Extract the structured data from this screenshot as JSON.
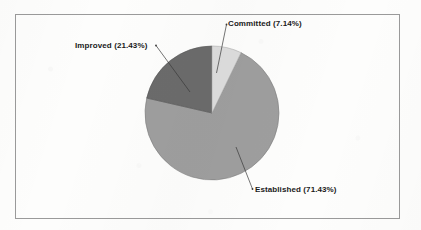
{
  "chart_data": {
    "type": "pie",
    "title": "",
    "subtitle": "",
    "xlabel": "",
    "ylabel": "",
    "grid": false,
    "legend_position": "none",
    "labels_position": "outside-with-leader-lines",
    "start_angle_deg": 0,
    "direction": "clockwise",
    "categories": [
      "Committed",
      "Established",
      "Improved"
    ],
    "values": [
      7.14,
      71.43,
      21.43
    ],
    "value_unit": "%",
    "slices": [
      {
        "name": "Committed",
        "value": 7.14,
        "label": "Committed (7.14%)",
        "color": "#dcdcdc",
        "start_angle_deg": 0,
        "end_angle_deg": 25.7
      },
      {
        "name": "Established",
        "value": 71.43,
        "label": "Established (71.43%)",
        "color": "#9e9e9e",
        "start_angle_deg": 25.7,
        "end_angle_deg": 282.9
      },
      {
        "name": "Improved",
        "value": 21.43,
        "label": "Improved (21.43%)",
        "color": "#6b6b6b",
        "start_angle_deg": 282.9,
        "end_angle_deg": 360
      }
    ]
  },
  "chart": {
    "border_color": "#9a9a9a",
    "background_color": "#fdfdfc",
    "label_color": "#1a1a1a",
    "leader_line_color": "#3a3a3a",
    "center_x": 212,
    "center_y": 113,
    "radius": 67
  },
  "labels": {
    "committed": "Committed (7.14%)",
    "improved": "Improved (21.43%)",
    "established": "Established (71.43%)"
  }
}
